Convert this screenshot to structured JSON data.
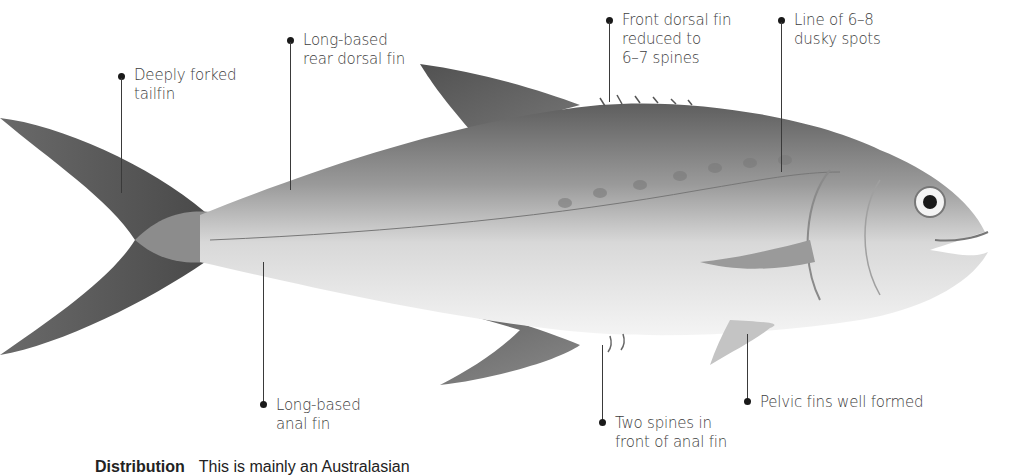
{
  "figure": {
    "colors": {
      "background": "#ffffff",
      "label_text": "#3d3d3d",
      "leader_line": "#3a3a3a",
      "dot": "#1a1a1a"
    }
  },
  "labels": {
    "tail": {
      "lines": [
        "Deeply forked",
        "tailfin"
      ]
    },
    "rear_dorsal": {
      "lines": [
        "Long-based",
        "rear dorsal fin"
      ]
    },
    "front_dorsal": {
      "lines": [
        "Front dorsal fin",
        "reduced to",
        "6–7 spines"
      ]
    },
    "spots": {
      "lines": [
        "Line of 6–8",
        "dusky spots"
      ]
    },
    "anal": {
      "lines": [
        "Long-based",
        "anal fin"
      ]
    },
    "anal_spines": {
      "lines": [
        "Two spines in",
        "front of anal fin"
      ]
    },
    "pelvic": {
      "lines": [
        "Pelvic fins well formed"
      ]
    }
  },
  "footer": {
    "heading": "Distribution",
    "text": "This is mainly an Australasian"
  }
}
